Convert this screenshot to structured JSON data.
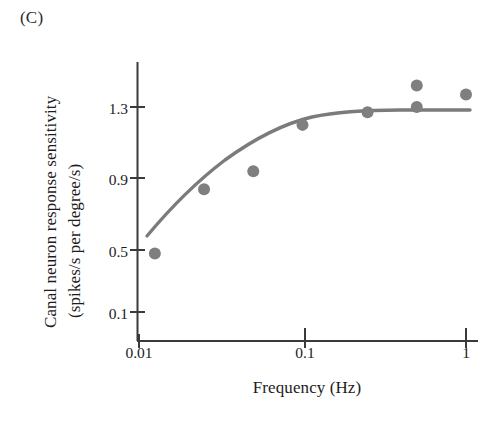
{
  "panel": {
    "label": "(C)"
  },
  "chart_data": {
    "type": "scatter",
    "title": "",
    "panel_label": "(C)",
    "xlabel": "Frequency (Hz)",
    "ylabel_line1": "Canal neuron response sensitivity",
    "ylabel_line2": "(spikes/s per degree/s)",
    "ylabel": "Canal neuron response sensitivity (spikes/s per degree/s)",
    "xscale": "log",
    "yscale": "linear",
    "grid": false,
    "legend": "none",
    "xlim": [
      0.01,
      1.15
    ],
    "ylim": [
      0.02,
      1.52
    ],
    "xticks": [
      0.01,
      0.1,
      1
    ],
    "xtick_labels": [
      "0.01",
      "0.1",
      "1"
    ],
    "yticks": [
      0.1,
      0.5,
      0.9,
      1.3
    ],
    "ytick_labels": [
      "0.1",
      "0.5",
      "0.9",
      "1.3"
    ],
    "marker": "filled-circle",
    "marker_color": "#7f7f7f",
    "line_color": "#7b7b7b",
    "axis_color": "#3a3a3a",
    "points": [
      {
        "x": 0.0125,
        "y": 0.48
      },
      {
        "x": 0.025,
        "y": 0.84
      },
      {
        "x": 0.05,
        "y": 0.94
      },
      {
        "x": 0.1,
        "y": 1.2
      },
      {
        "x": 0.25,
        "y": 1.27
      },
      {
        "x": 0.5,
        "y": 1.3
      },
      {
        "x": 0.5,
        "y": 1.42
      },
      {
        "x": 1.0,
        "y": 1.37
      }
    ],
    "series": [
      {
        "name": "canal neuron sensitivity",
        "x": [
          0.0125,
          0.025,
          0.05,
          0.1,
          0.25,
          0.5,
          0.5,
          1.0
        ],
        "values": [
          0.48,
          0.84,
          0.94,
          1.2,
          1.27,
          1.3,
          1.42,
          1.37
        ]
      },
      {
        "name": "fitted curve",
        "type": "line",
        "x": [
          0.0135,
          0.018,
          0.025,
          0.035,
          0.05,
          0.07,
          0.1,
          0.14,
          0.2,
          0.3,
          0.5,
          0.8,
          1.1
        ],
        "values": [
          0.56,
          0.68,
          0.81,
          0.94,
          1.06,
          1.15,
          1.23,
          1.28,
          1.31,
          1.32,
          1.32,
          1.32,
          1.32
        ],
        "plateau": 1.32
      }
    ],
    "annotations": []
  },
  "axes": {
    "x_title": "Frequency (Hz)",
    "y_title_line1": "Canal neuron response sensitivity",
    "y_title_line2": "(spikes/s per degree/s)"
  }
}
